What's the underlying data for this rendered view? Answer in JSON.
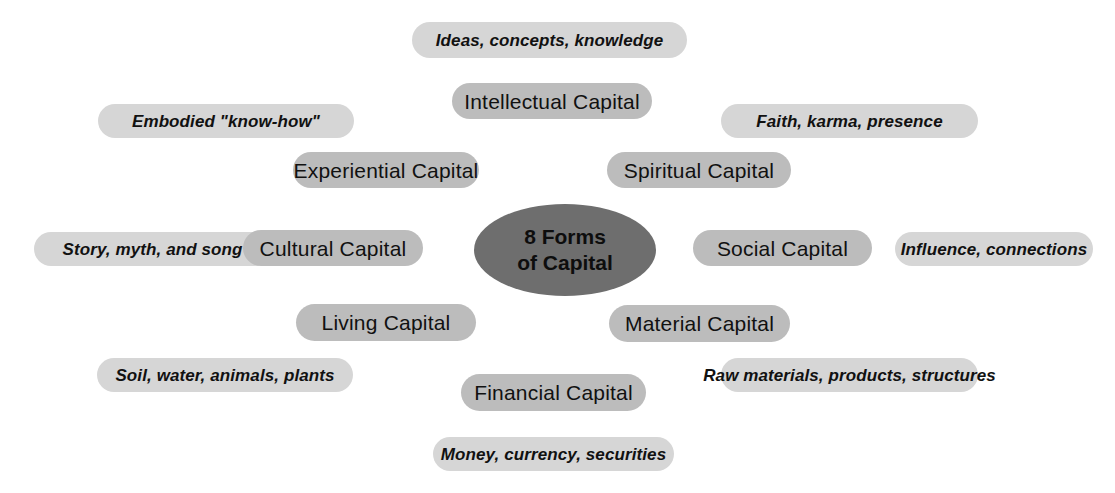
{
  "diagram": {
    "title": "8 Forms of Capital",
    "center": {
      "line1": "8 Forms",
      "line2": "of Capital",
      "fill": "#6e6e6e"
    },
    "colors": {
      "node_pill": "#bcbcbc",
      "descriptor_pill": "#d6d6d6",
      "text": "#111111",
      "background": "#ffffff"
    },
    "forms": [
      {
        "name": "Intellectual Capital",
        "descriptor": "Ideas, concepts, knowledge"
      },
      {
        "name": "Experiential Capital",
        "descriptor": "Embodied \"know-how\""
      },
      {
        "name": "Spiritual Capital",
        "descriptor": "Faith, karma, presence"
      },
      {
        "name": "Cultural Capital",
        "descriptor": "Story, myth, and song"
      },
      {
        "name": "Social Capital",
        "descriptor": "Influence, connections"
      },
      {
        "name": "Living Capital",
        "descriptor": "Soil, water, animals, plants"
      },
      {
        "name": "Material Capital",
        "descriptor": "Raw materials, products, structures"
      },
      {
        "name": "Financial Capital",
        "descriptor": "Money, currency, securities"
      }
    ]
  }
}
